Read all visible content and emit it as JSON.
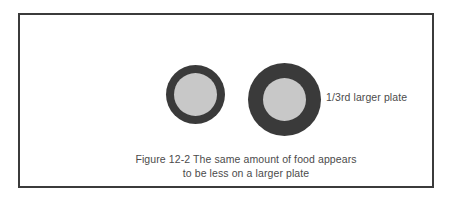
{
  "figure": {
    "frame": {
      "border_color": "#3b3b3b",
      "background_color": "#ffffff"
    },
    "plates": [
      {
        "id": "small-plate",
        "role": "standard plate",
        "rim_color": "#3a3a3a",
        "food_color": "#c8c8c8",
        "outer_diameter_px": 59,
        "rim_thickness_px": 8,
        "food_diameter_px": 43
      },
      {
        "id": "large-plate",
        "role": "larger plate",
        "rim_color": "#3a3a3a",
        "food_color": "#c8c8c8",
        "outer_diameter_px": 73,
        "rim_thickness_px": 15,
        "food_diameter_px": 43
      }
    ],
    "annotation": {
      "text": "1/3rd larger plate"
    },
    "caption": {
      "line1": "Figure 12-2 The same amount of food appears",
      "line2": "to be less on a larger plate"
    }
  }
}
